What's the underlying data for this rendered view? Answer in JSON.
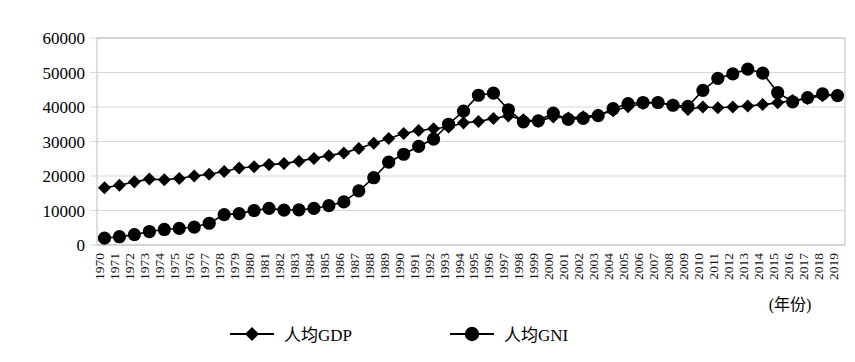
{
  "chart_data": {
    "type": "line",
    "title": "",
    "xlabel": "(年份)",
    "ylabel": "",
    "ylim": [
      0,
      60000
    ],
    "ytick_values": [
      0,
      10000,
      20000,
      30000,
      40000,
      50000,
      60000
    ],
    "ytick_labels": [
      "0",
      "10000",
      "20000",
      "30000",
      "40000",
      "50000",
      "60000"
    ],
    "grid": true,
    "legend_position": "bottom",
    "x": [
      1970,
      1971,
      1972,
      1973,
      1974,
      1975,
      1976,
      1977,
      1978,
      1979,
      1980,
      1981,
      1982,
      1983,
      1984,
      1985,
      1986,
      1987,
      1988,
      1989,
      1990,
      1991,
      1992,
      1993,
      1994,
      1995,
      1996,
      1997,
      1998,
      1999,
      2000,
      2001,
      2002,
      2003,
      2004,
      2005,
      2006,
      2007,
      2008,
      2009,
      2010,
      2011,
      2012,
      2013,
      2014,
      2015,
      2016,
      2017,
      2018,
      2019
    ],
    "categories": [
      "1970",
      "1971",
      "1972",
      "1973",
      "1974",
      "1975",
      "1976",
      "1977",
      "1978",
      "1979",
      "1980",
      "1981",
      "1982",
      "1983",
      "1984",
      "1985",
      "1986",
      "1987",
      "1988",
      "1989",
      "1990",
      "1991",
      "1992",
      "1993",
      "1994",
      "1995",
      "1996",
      "1997",
      "1998",
      "1999",
      "2000",
      "2001",
      "2002",
      "2003",
      "2004",
      "2005",
      "2006",
      "2007",
      "2008",
      "2009",
      "2010",
      "2011",
      "2012",
      "2013",
      "2014",
      "2015",
      "2016",
      "2017",
      "2018",
      "2019"
    ],
    "series": [
      {
        "name": "人均GDP",
        "marker": "diamond",
        "color": "#000000",
        "values": [
          16600,
          17300,
          18300,
          19100,
          18900,
          19300,
          20000,
          20500,
          21300,
          22300,
          22700,
          23300,
          23600,
          24300,
          25100,
          25900,
          26700,
          28000,
          29500,
          30900,
          32300,
          33200,
          33700,
          34200,
          35400,
          35800,
          36700,
          37400,
          36300,
          35900,
          37100,
          36800,
          37200,
          37700,
          38900,
          40100,
          41000,
          41300,
          40600,
          39300,
          40000,
          39800,
          40000,
          40300,
          40700,
          41200,
          41900,
          42500,
          43300,
          43400
        ],
        "marker_size": 6.2
      },
      {
        "name": "人均GNI",
        "marker": "circle",
        "color": "#000000",
        "values": [
          2000,
          2400,
          3000,
          3900,
          4500,
          4800,
          5200,
          6300,
          8800,
          9100,
          10000,
          10600,
          10100,
          10200,
          10600,
          11400,
          12500,
          15700,
          19500,
          24000,
          26300,
          28600,
          30700,
          35000,
          38800,
          43400,
          44000,
          39200,
          35700,
          36000,
          38200,
          36400,
          36700,
          37500,
          39500,
          41000,
          41300,
          41300,
          40500,
          40200,
          44800,
          48300,
          49600,
          51000,
          49800,
          44200,
          41500,
          42700,
          43800,
          43300
        ],
        "marker_size": 6.6
      }
    ]
  },
  "legend": {
    "items": [
      {
        "label": "人均GDP",
        "marker": "diamond"
      },
      {
        "label": "人均GNI",
        "marker": "circle"
      }
    ]
  },
  "axis": {
    "x_caption": "(年份)"
  }
}
